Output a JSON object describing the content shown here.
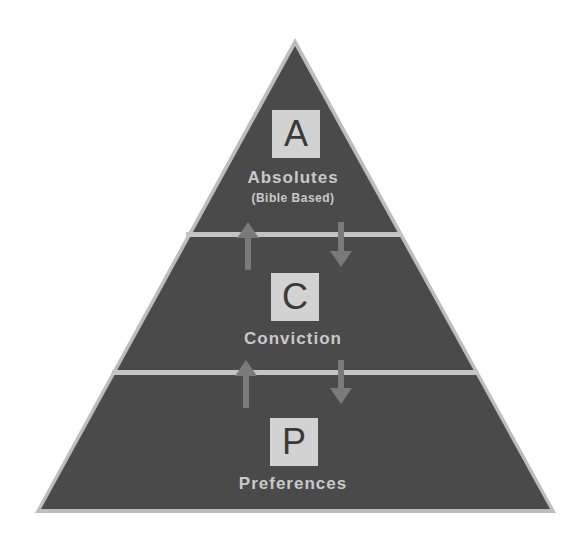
{
  "diagram": {
    "type": "pyramid",
    "colors": {
      "fill": "#4a4a4a",
      "outline": "#bdbdbd",
      "separator": "#c4c4c4",
      "arrow": "#7a7a7a",
      "box_fill": "#d2d2d2",
      "box_text": "#3a3a3a",
      "label_text": "#c9c9c9"
    },
    "tiers": [
      {
        "letter": "A",
        "label": "Absolutes",
        "sublabel": "(Bible Based)"
      },
      {
        "letter": "C",
        "label": "Conviction",
        "sublabel": ""
      },
      {
        "letter": "P",
        "label": "Preferences",
        "sublabel": ""
      }
    ],
    "connectors": [
      {
        "between": [
          "Absolutes",
          "Conviction"
        ],
        "arrows": [
          "up",
          "down"
        ]
      },
      {
        "between": [
          "Conviction",
          "Preferences"
        ],
        "arrows": [
          "up",
          "down"
        ]
      }
    ]
  }
}
